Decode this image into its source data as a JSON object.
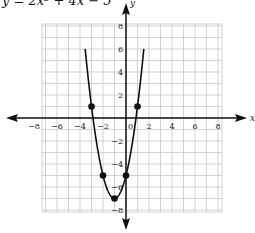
{
  "chart_data": {
    "type": "line",
    "title": "y = 2x² + 4x − 5",
    "xlabel": "x",
    "ylabel": "y",
    "xlim": [
      -8,
      8
    ],
    "ylim": [
      -8,
      8
    ],
    "grid": true,
    "x_ticks": [
      -8,
      -6,
      -4,
      -2,
      0,
      2,
      4,
      6,
      8
    ],
    "y_ticks": [
      -8,
      -6,
      -4,
      -2,
      2,
      4,
      6,
      8
    ],
    "x_tick_labels": [
      "−8",
      "−6",
      "−4",
      "−2",
      "0",
      "2",
      "4",
      "6",
      "8"
    ],
    "y_tick_labels": [
      "−8",
      "−6",
      "−4",
      "−2",
      "2",
      "4",
      "6",
      "8"
    ],
    "function": {
      "a": 2,
      "b": 4,
      "c": -5,
      "x_range": [
        -3.55,
        1.55
      ]
    },
    "points": [
      {
        "x": -3,
        "y": 1
      },
      {
        "x": -2,
        "y": -5
      },
      {
        "x": -1,
        "y": -7
      },
      {
        "x": 0,
        "y": -5
      },
      {
        "x": 1,
        "y": 1
      }
    ],
    "colors": {
      "curve": "#111111",
      "grid": "#c8c8c8",
      "axis": "#111111",
      "point": "#111111"
    }
  }
}
